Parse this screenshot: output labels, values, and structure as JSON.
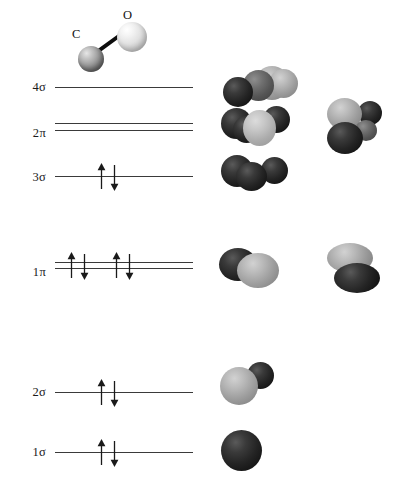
{
  "diagram": {
    "molecule": {
      "name": "carbon monoxide",
      "atoms": [
        {
          "label": "C",
          "element": "carbon",
          "shade": "dark-gray"
        },
        {
          "label": "O",
          "element": "oxygen",
          "shade": "light-gray"
        }
      ],
      "bond": "single-rod"
    },
    "levels": [
      {
        "id": "4sigma",
        "label": "4σ",
        "type": "single",
        "electrons": 0,
        "electron_pairs": 0,
        "occupied": false
      },
      {
        "id": "2pi",
        "label": "2π",
        "type": "double",
        "electrons": 0,
        "electron_pairs": 0,
        "occupied": false
      },
      {
        "id": "3sigma",
        "label": "3σ",
        "type": "single",
        "electrons": 2,
        "electron_pairs": 1,
        "occupied": true
      },
      {
        "id": "1pi",
        "label": "1π",
        "type": "double",
        "electrons": 4,
        "electron_pairs": 2,
        "occupied": true
      },
      {
        "id": "2sigma",
        "label": "2σ",
        "type": "single",
        "electrons": 2,
        "electron_pairs": 1,
        "occupied": true
      },
      {
        "id": "1sigma",
        "label": "1σ",
        "type": "single",
        "electrons": 2,
        "electron_pairs": 1,
        "occupied": true
      }
    ],
    "orbital_images": {
      "4sigma_a": "antibonding sigma: dark lobe left, light lobes right",
      "2pi_a": "pi star: dark lobes left and right, light lobe center front",
      "2pi_b": "pi star rotated: light lobe upper left, dark lobes upper right and lower",
      "3sigma_a": "sigma lone pair: all dark lobes",
      "1pi_a": "pi bonding: dark ellipse left, light ellipse right",
      "1pi_b": "pi bonding rotated: light ellipse top, dark ellipse bottom",
      "2sigma_a": "sigma bonding: large light sphere front, dark sphere behind",
      "1sigma_a": "core sigma: single dark sphere"
    },
    "colors": {
      "line": "#3a3a3a",
      "arrow": "#1a1a1a",
      "lobe_dark": "#1b1b1b",
      "lobe_light": "#b9b9b9",
      "background": "#ffffff"
    }
  }
}
